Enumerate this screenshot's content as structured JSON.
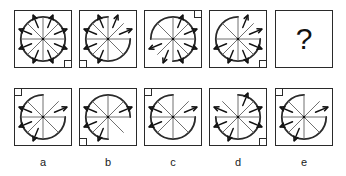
{
  "puzzle": {
    "type": "matrix-reasoning",
    "question_mark": "?",
    "geometry": {
      "cell_size_px": 58,
      "circle_radius_px": 23,
      "sector_count": 8,
      "corner_square_px": 8
    },
    "matrix": {
      "name": "matrix-row",
      "cells": [
        {
          "id": "matrix-cell-1",
          "corner_square": "bottom-right",
          "arc_gap": "none",
          "arrow_sectors": [
            0,
            1,
            2,
            3,
            4,
            5,
            6,
            7
          ],
          "spokes": 8
        },
        {
          "id": "matrix-cell-2",
          "corner_square": "bottom-left",
          "arc_gap": "upper-right",
          "arrow_sectors": [
            0,
            1,
            4,
            5,
            6,
            7
          ],
          "spokes": 8
        },
        {
          "id": "matrix-cell-3",
          "corner_square": "top-right",
          "arc_gap": "lower-left",
          "arrow_sectors": [
            0,
            1,
            2,
            3,
            4,
            5
          ],
          "spokes": 8
        },
        {
          "id": "matrix-cell-4",
          "corner_square": "bottom-right",
          "arc_gap": "upper-right",
          "arrow_sectors": [
            0,
            1,
            2,
            3,
            4,
            5
          ],
          "spokes": 8
        },
        {
          "id": "matrix-cell-5",
          "corner_square": "none",
          "arc_gap": "none",
          "arrow_sectors": [],
          "spokes": 0,
          "is_question": true
        }
      ]
    },
    "options": {
      "name": "options-row",
      "items": [
        {
          "id": "option-a",
          "label": "a",
          "corner_square": "top-left",
          "arc_gap": "upper-right",
          "arrow_sectors": [
            1,
            4,
            5,
            6
          ],
          "spokes": 8
        },
        {
          "id": "option-b",
          "label": "b",
          "corner_square": "bottom-left",
          "arc_gap": "lower-right",
          "arrow_sectors": [
            1,
            4,
            5,
            6
          ],
          "spokes": 8
        },
        {
          "id": "option-c",
          "label": "c",
          "corner_square": "top-left",
          "arc_gap": "upper-right",
          "arrow_sectors": [
            1,
            5,
            6
          ],
          "spokes": 8
        },
        {
          "id": "option-d",
          "label": "d",
          "corner_square": "bottom-right",
          "arc_gap": "upper-left",
          "arrow_sectors": [
            0,
            1,
            2,
            4,
            5,
            6
          ],
          "spokes": 8
        },
        {
          "id": "option-e",
          "label": "e",
          "corner_square": "top-left",
          "arc_gap": "upper-right",
          "arrow_sectors": [
            1,
            4,
            5,
            6
          ],
          "spokes": 8
        }
      ]
    },
    "colors": {
      "stroke": "#2a2a2a",
      "arrow": "#111111",
      "spoke": "#5a5a5a",
      "background": "#ffffff"
    }
  }
}
